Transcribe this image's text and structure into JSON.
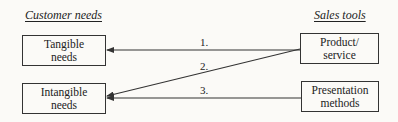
{
  "headings": {
    "left": "Customer needs",
    "right": "Sales tools"
  },
  "needs": [
    {
      "line1": "Tangible",
      "line2": "needs"
    },
    {
      "line1": "Intangible",
      "line2": "needs"
    }
  ],
  "tools": [
    {
      "line1": "Product/",
      "line2": "service"
    },
    {
      "line1": "Presentation",
      "line2": "methods"
    }
  ],
  "arrows": [
    {
      "label": "1.",
      "from": "Product/service",
      "to": "Tangible needs"
    },
    {
      "label": "2.",
      "from": "Product/service",
      "to": "Intangible needs"
    },
    {
      "label": "3.",
      "from": "Presentation methods",
      "to": "Intangible needs"
    }
  ]
}
